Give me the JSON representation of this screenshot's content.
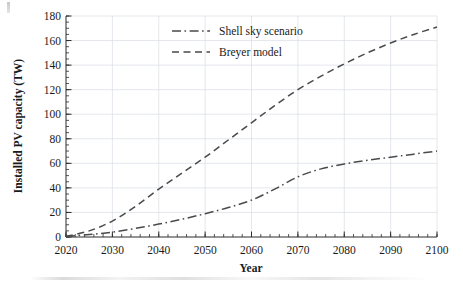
{
  "chart_data": {
    "type": "line",
    "title": "",
    "xlabel": "Year",
    "ylabel": "Installed PV capacity (TW)",
    "xlim": [
      2020,
      2100
    ],
    "ylim": [
      0,
      180
    ],
    "xticks": [
      2020,
      2030,
      2040,
      2050,
      2060,
      2070,
      2080,
      2090,
      2100
    ],
    "yticks": [
      0,
      20,
      40,
      60,
      80,
      100,
      120,
      140,
      160,
      180
    ],
    "xtick_labels": [
      "2020",
      "2030",
      "2040",
      "2050",
      "2060",
      "2070",
      "2080",
      "2090",
      "2100"
    ],
    "ytick_labels": [
      "0",
      "20",
      "40",
      "60",
      "80",
      "100",
      "120",
      "140",
      "160",
      "180"
    ],
    "x_minor_tick_step": 2,
    "y_minor_tick_step": 5,
    "grid": true,
    "grid_color": "#d9dde4",
    "legend_position": "upper center",
    "x": [
      2020,
      2025,
      2030,
      2035,
      2040,
      2045,
      2050,
      2055,
      2060,
      2065,
      2070,
      2075,
      2080,
      2085,
      2090,
      2095,
      2100
    ],
    "series": [
      {
        "name": "Shell sky scenario",
        "linestyle": "dashdot",
        "color": "#4a4a4a",
        "values": [
          0.5,
          2.0,
          4.0,
          7.0,
          10.5,
          14.5,
          19.0,
          24.0,
          30.0,
          39.0,
          49.0,
          55.5,
          59.5,
          62.5,
          65.0,
          67.5,
          70.0
        ]
      },
      {
        "name": "Breyer model",
        "linestyle": "dashed",
        "color": "#4a4a4a",
        "values": [
          0.5,
          5.0,
          13.0,
          25.0,
          39.0,
          52.0,
          65.0,
          79.0,
          93.0,
          107.0,
          120.0,
          131.0,
          141.0,
          150.0,
          158.0,
          165.0,
          171.0
        ]
      }
    ]
  },
  "legend": {
    "items": [
      {
        "label": "Shell sky scenario",
        "style": "dashdot"
      },
      {
        "label": "Breyer model",
        "style": "dashed"
      }
    ]
  },
  "axes": {
    "x_title": "Year",
    "y_title": "Installed PV capacity (TW)"
  }
}
